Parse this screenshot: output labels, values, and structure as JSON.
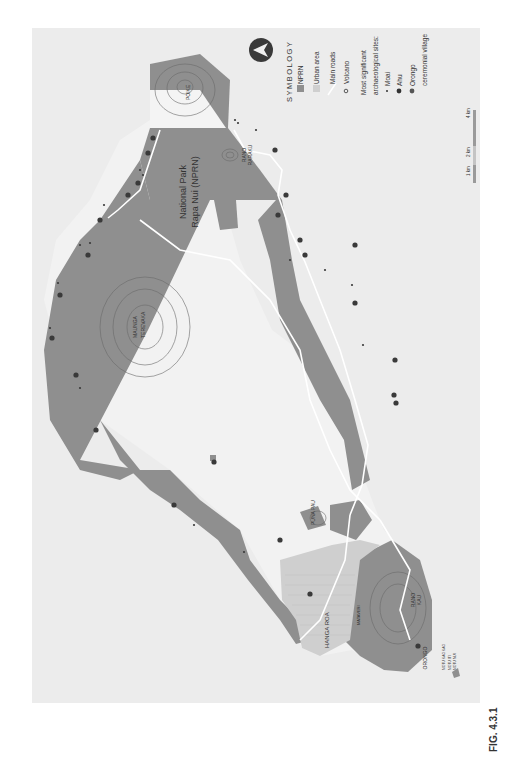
{
  "figure": {
    "caption": "FIG. 4.3.1",
    "orientation": "rotated 90° (text reads bottom-to-top)"
  },
  "legend": {
    "title": "SYMBOLOGY",
    "items": [
      {
        "label": "NPRN",
        "symbol": "swatch",
        "color": "#8f8f8f"
      },
      {
        "label": "Urban area",
        "symbol": "swatch",
        "color": "#c8c8c8"
      },
      {
        "label": "Main roads",
        "symbol": "line",
        "color": "#ffffff"
      },
      {
        "label": "Volcano",
        "symbol": "ring",
        "color": "#333333"
      }
    ],
    "sites_heading_1": "Most significant",
    "sites_heading_2": "archaeological sites:",
    "sites": [
      {
        "label": "Moai",
        "symbol": "small-dot"
      },
      {
        "label": "Ahu",
        "symbol": "hex-dot"
      },
      {
        "label": "Orongo",
        "symbol": "round-dot"
      },
      {
        "label": "ceremonial village",
        "symbol": "none"
      }
    ]
  },
  "scale_bar": {
    "labels": [
      "1 km",
      "2 km",
      "4 km"
    ]
  },
  "north_arrow": {
    "icon": "north-arrow-icon"
  },
  "map": {
    "park_label_1": "National Park",
    "park_label_2": "Rapa Nui (NPRN)",
    "places": [
      {
        "name": "POIKE",
        "type": "volcano"
      },
      {
        "name": "RANO",
        "name2": "RARAKU",
        "type": "volcano"
      },
      {
        "name": "MAUNGA",
        "name2": "TEREVAKA",
        "type": "volcano"
      },
      {
        "name": "PUNA PAU",
        "type": "volcano"
      },
      {
        "name": "HANGA ROA",
        "type": "urban"
      },
      {
        "name": "MATAVERI",
        "type": "urban"
      },
      {
        "name": "RANO",
        "name2": "KAU",
        "type": "volcano"
      },
      {
        "name": "ORONGO",
        "type": "site"
      },
      {
        "name": "MOTU KAO KAO",
        "type": "islet"
      },
      {
        "name": "MOTU ITI",
        "type": "islet"
      },
      {
        "name": "MOTU NUI",
        "type": "islet"
      }
    ]
  },
  "colors": {
    "background": "#ececec",
    "nprn": "#8f8f8f",
    "land": "#f2f2f2",
    "urban": "#cfcfcf",
    "road": "#ffffff",
    "contour": "#6a6a6a",
    "site": "#3a3a3a"
  }
}
